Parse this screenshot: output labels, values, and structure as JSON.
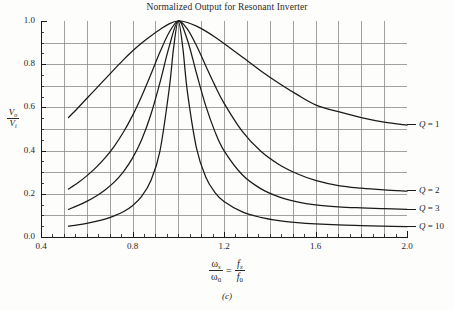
{
  "figure": {
    "title": "Normalized Output for Resonant Inverter",
    "caption": "(c)",
    "ylabel": {
      "numerator": "V",
      "numerator_sub": "o",
      "denominator": "V",
      "denominator_sub": "i"
    },
    "xlabel": {
      "left_num": "ω",
      "left_num_sub": "s",
      "left_den": "ω",
      "left_den_sub": "0",
      "equals": "=",
      "right_num": "f",
      "right_num_sub": "s",
      "right_den": "f",
      "right_den_sub": "0"
    }
  },
  "chart_data": {
    "type": "line",
    "title": "Normalized Output for Resonant Inverter",
    "xlabel": "ωs/ω0 = fs/f0",
    "ylabel": "Vo/Vi",
    "xlim": [
      0.4,
      2.0
    ],
    "ylim": [
      0.0,
      1.0
    ],
    "xticks": [
      0.4,
      0.8,
      1.2,
      1.6,
      2.0
    ],
    "xtick_labels": [
      "0.4",
      "0.8",
      "1.2",
      "1.6",
      "2.0"
    ],
    "yticks": [
      0.0,
      0.2,
      0.4,
      0.6,
      0.8,
      1.0
    ],
    "ytick_labels": [
      "0.0",
      "0.2",
      "0.4",
      "0.6",
      "0.8",
      "1.0"
    ],
    "minor_xtick_step": 0.05,
    "minor_ytick_step": 0.05,
    "grid": true,
    "grid_x_step": 0.1,
    "grid_y_step": 0.1,
    "grid_color": "#8a8a8a",
    "curve_color": "#1a1a1a",
    "legend_position": "right-inline",
    "series": [
      {
        "name": "Q = 1",
        "q": 1,
        "label_x": 2.04,
        "label_y": 0.52,
        "points": [
          [
            0.52,
            0.553
          ],
          [
            0.56,
            0.596
          ],
          [
            0.6,
            0.641
          ],
          [
            0.64,
            0.686
          ],
          [
            0.68,
            0.731
          ],
          [
            0.72,
            0.776
          ],
          [
            0.76,
            0.82
          ],
          [
            0.8,
            0.861
          ],
          [
            0.84,
            0.898
          ],
          [
            0.88,
            0.931
          ],
          [
            0.92,
            0.961
          ],
          [
            0.96,
            0.987
          ],
          [
            1.0,
            1.0
          ],
          [
            1.04,
            0.993
          ],
          [
            1.08,
            0.976
          ],
          [
            1.12,
            0.953
          ],
          [
            1.16,
            0.926
          ],
          [
            1.2,
            0.896
          ],
          [
            1.28,
            0.833
          ],
          [
            1.36,
            0.77
          ],
          [
            1.44,
            0.712
          ],
          [
            1.52,
            0.659
          ],
          [
            1.6,
            0.612
          ],
          [
            1.7,
            0.58
          ],
          [
            1.8,
            0.553
          ],
          [
            1.9,
            0.532
          ],
          [
            2.0,
            0.518
          ]
        ]
      },
      {
        "name": "Q = 2",
        "q": 2,
        "label_x": 2.04,
        "label_y": 0.215,
        "points": [
          [
            0.52,
            0.222
          ],
          [
            0.56,
            0.25
          ],
          [
            0.6,
            0.283
          ],
          [
            0.64,
            0.321
          ],
          [
            0.68,
            0.366
          ],
          [
            0.72,
            0.42
          ],
          [
            0.76,
            0.485
          ],
          [
            0.8,
            0.562
          ],
          [
            0.84,
            0.652
          ],
          [
            0.88,
            0.752
          ],
          [
            0.92,
            0.856
          ],
          [
            0.96,
            0.947
          ],
          [
            1.0,
            1.0
          ],
          [
            1.04,
            0.962
          ],
          [
            1.08,
            0.885
          ],
          [
            1.12,
            0.793
          ],
          [
            1.16,
            0.702
          ],
          [
            1.2,
            0.62
          ],
          [
            1.28,
            0.489
          ],
          [
            1.36,
            0.398
          ],
          [
            1.44,
            0.336
          ],
          [
            1.52,
            0.293
          ],
          [
            1.6,
            0.262
          ],
          [
            1.7,
            0.238
          ],
          [
            1.8,
            0.226
          ],
          [
            1.9,
            0.218
          ],
          [
            2.0,
            0.212
          ]
        ]
      },
      {
        "name": "Q = 3",
        "q": 3,
        "label_x": 2.04,
        "label_y": 0.128,
        "points": [
          [
            0.52,
            0.128
          ],
          [
            0.56,
            0.145
          ],
          [
            0.6,
            0.165
          ],
          [
            0.64,
            0.189
          ],
          [
            0.68,
            0.218
          ],
          [
            0.72,
            0.254
          ],
          [
            0.76,
            0.302
          ],
          [
            0.8,
            0.365
          ],
          [
            0.84,
            0.45
          ],
          [
            0.88,
            0.566
          ],
          [
            0.92,
            0.715
          ],
          [
            0.96,
            0.88
          ],
          [
            1.0,
            1.0
          ],
          [
            1.04,
            0.912
          ],
          [
            1.08,
            0.757
          ],
          [
            1.12,
            0.608
          ],
          [
            1.16,
            0.489
          ],
          [
            1.2,
            0.4
          ],
          [
            1.28,
            0.288
          ],
          [
            1.36,
            0.224
          ],
          [
            1.44,
            0.186
          ],
          [
            1.52,
            0.163
          ],
          [
            1.6,
            0.149
          ],
          [
            1.7,
            0.14
          ],
          [
            1.8,
            0.135
          ],
          [
            1.9,
            0.131
          ],
          [
            2.0,
            0.128
          ]
        ]
      },
      {
        "name": "Q = 10",
        "q": 10,
        "label_x": 2.04,
        "label_y": 0.048,
        "points": [
          [
            0.52,
            0.05
          ],
          [
            0.56,
            0.056
          ],
          [
            0.6,
            0.063
          ],
          [
            0.64,
            0.072
          ],
          [
            0.68,
            0.083
          ],
          [
            0.72,
            0.098
          ],
          [
            0.76,
            0.117
          ],
          [
            0.8,
            0.145
          ],
          [
            0.84,
            0.188
          ],
          [
            0.88,
            0.26
          ],
          [
            0.92,
            0.398
          ],
          [
            0.96,
            0.682
          ],
          [
            0.98,
            0.878
          ],
          [
            1.0,
            1.0
          ],
          [
            1.02,
            0.876
          ],
          [
            1.04,
            0.672
          ],
          [
            1.08,
            0.41
          ],
          [
            1.12,
            0.278
          ],
          [
            1.16,
            0.207
          ],
          [
            1.2,
            0.164
          ],
          [
            1.28,
            0.116
          ],
          [
            1.36,
            0.091
          ],
          [
            1.44,
            0.076
          ],
          [
            1.52,
            0.067
          ],
          [
            1.6,
            0.061
          ],
          [
            1.7,
            0.056
          ],
          [
            1.8,
            0.053
          ],
          [
            1.9,
            0.05
          ],
          [
            2.0,
            0.048
          ]
        ]
      }
    ]
  },
  "axes": {
    "plot_left_px": 41,
    "plot_right_px": 407,
    "plot_top_px": 21,
    "plot_bottom_px": 237
  }
}
